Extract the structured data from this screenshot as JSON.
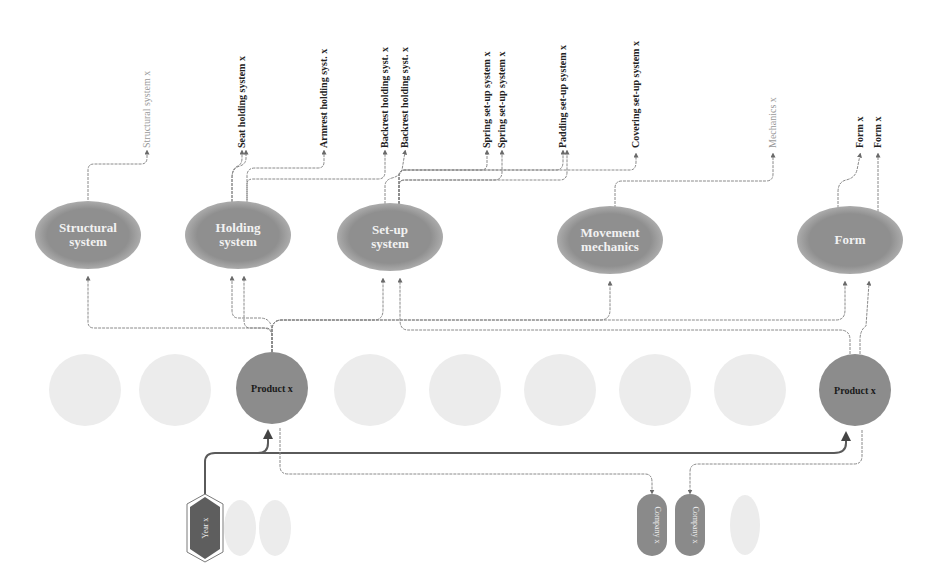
{
  "colors": {
    "ellipse_fill": "#8f8f8f",
    "ellipse_edge": "#b5b5b5",
    "product_fill": "#8c8c8c",
    "year_fill": "#5e5e5e",
    "company_fill": "#8a8a8a",
    "faded_fill": "#ececec",
    "line": "#8a8a8a"
  },
  "leaf_labels": [
    {
      "id": "structural-system-x",
      "text": "Structural system x",
      "x": 147,
      "faint": true
    },
    {
      "id": "seat-holding-system-x",
      "text": "Seat holding system x",
      "x": 242,
      "faint": false
    },
    {
      "id": "armrest-holding-syst-x",
      "text": "Armrest holding syst. x",
      "x": 324,
      "faint": false
    },
    {
      "id": "backrest-holding-syst-x-1",
      "text": "Backrest holding syst. x",
      "x": 385,
      "faint": false
    },
    {
      "id": "backrest-holding-syst-x-2",
      "text": "Backrest holding syst. x",
      "x": 405,
      "faint": false
    },
    {
      "id": "spring-set-up-system-x-1",
      "text": "Spring set-up system x",
      "x": 487,
      "faint": false
    },
    {
      "id": "spring-set-up-system-x-2",
      "text": "Spring set-up system x",
      "x": 502,
      "faint": false
    },
    {
      "id": "padding-set-up-system-x",
      "text": "Padding set-up system x",
      "x": 563,
      "faint": false
    },
    {
      "id": "covering-set-up-system-x",
      "text": "Covering set-up system x",
      "x": 636,
      "faint": false
    },
    {
      "id": "mechanics-x",
      "text": "Mechanics x",
      "x": 773,
      "faint": true
    },
    {
      "id": "form-x-1",
      "text": "Form x",
      "x": 860,
      "faint": false
    },
    {
      "id": "form-x-2",
      "text": "Form x",
      "x": 878,
      "faint": false
    }
  ],
  "categories": [
    {
      "id": "structural-system",
      "line1": "Structural",
      "line2": "system",
      "cx": 88,
      "cy": 235
    },
    {
      "id": "holding-system",
      "line1": "Holding",
      "line2": "system",
      "cx": 238,
      "cy": 235
    },
    {
      "id": "set-up-system",
      "line1": "Set-up",
      "line2": "system",
      "cx": 390,
      "cy": 237
    },
    {
      "id": "movement-mechanics",
      "line1": "Movement",
      "line2": "mechanics",
      "cx": 610,
      "cy": 240
    },
    {
      "id": "form",
      "line1": "Form",
      "line2": "",
      "cx": 850,
      "cy": 240
    }
  ],
  "products": [
    {
      "id": "product-1",
      "text": "Product x",
      "cx": 272,
      "cy": 388
    },
    {
      "id": "product-2",
      "text": "Product x",
      "cx": 855,
      "cy": 390
    }
  ],
  "faded_products": [
    85,
    175,
    370,
    465,
    560,
    655,
    750
  ],
  "year": {
    "text": "Year x",
    "cx": 205,
    "cy": 528
  },
  "faded_years": [
    240,
    275
  ],
  "companies": [
    {
      "id": "company-1",
      "text": "Company x",
      "cx": 652,
      "cy": 525
    },
    {
      "id": "company-2",
      "text": "Company x",
      "cx": 690,
      "cy": 525
    }
  ],
  "faded_companies": [
    745
  ]
}
